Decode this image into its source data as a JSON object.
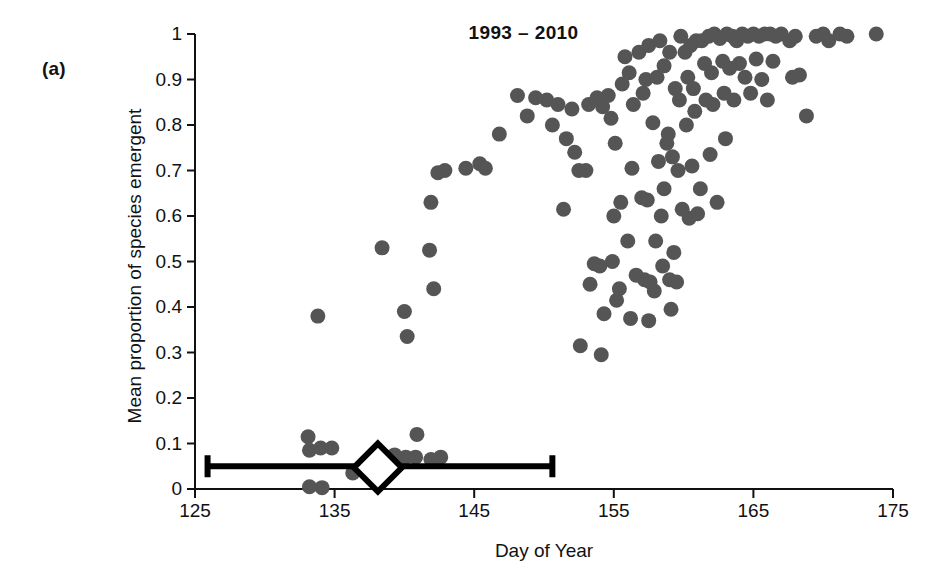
{
  "panel": {
    "label": "(a)"
  },
  "chart_data": {
    "type": "scatter",
    "title": "1993 – 2010",
    "xlabel": "Day of Year",
    "ylabel": "Mean proportion of species emergent",
    "xlim": [
      125,
      175
    ],
    "ylim": [
      0,
      1
    ],
    "xticks": [
      125,
      135,
      145,
      155,
      165,
      175
    ],
    "xtick_labels": [
      "125",
      "135",
      "145",
      "155",
      "165",
      "175"
    ],
    "yticks": [
      0,
      0.1,
      0.2,
      0.3,
      0.4,
      0.5,
      0.6,
      0.7,
      0.8,
      0.9,
      1
    ],
    "ytick_labels": [
      "0",
      "0.1",
      "0.2",
      "0.3",
      "0.4",
      "0.5",
      "0.6",
      "0.7",
      "0.8",
      "0.9",
      "1"
    ],
    "grid": false,
    "legend": "none",
    "marker": {
      "shape": "circle",
      "color": "#555555",
      "size_px": 15
    },
    "points": [
      [
        133.1,
        0.115
      ],
      [
        133.2,
        0.085
      ],
      [
        134.0,
        0.09
      ],
      [
        134.8,
        0.09
      ],
      [
        133.2,
        0.005
      ],
      [
        134.1,
        0.003
      ],
      [
        133.8,
        0.38
      ],
      [
        136.3,
        0.035
      ],
      [
        137.7,
        0.04
      ],
      [
        139.3,
        0.075
      ],
      [
        140.1,
        0.07
      ],
      [
        140.8,
        0.07
      ],
      [
        142.6,
        0.07
      ],
      [
        140.9,
        0.12
      ],
      [
        141.9,
        0.065
      ],
      [
        138.4,
        0.53
      ],
      [
        140.0,
        0.39
      ],
      [
        140.2,
        0.335
      ],
      [
        141.8,
        0.525
      ],
      [
        142.1,
        0.44
      ],
      [
        142.4,
        0.695
      ],
      [
        142.9,
        0.7
      ],
      [
        141.9,
        0.63
      ],
      [
        144.4,
        0.705
      ],
      [
        145.4,
        0.715
      ],
      [
        145.8,
        0.705
      ],
      [
        146.8,
        0.78
      ],
      [
        148.1,
        0.865
      ],
      [
        151.4,
        0.615
      ],
      [
        152.5,
        0.7
      ],
      [
        152.0,
        0.835
      ],
      [
        153.2,
        0.845
      ],
      [
        154.2,
        0.84
      ],
      [
        152.6,
        0.315
      ],
      [
        154.1,
        0.295
      ],
      [
        153.3,
        0.45
      ],
      [
        153.6,
        0.495
      ],
      [
        154.0,
        0.49
      ],
      [
        154.3,
        0.385
      ],
      [
        155.2,
        0.415
      ],
      [
        155.4,
        0.44
      ],
      [
        155.0,
        0.6
      ],
      [
        155.5,
        0.63
      ],
      [
        154.8,
        0.815
      ],
      [
        155.6,
        0.89
      ],
      [
        156.1,
        0.915
      ],
      [
        156.4,
        0.845
      ],
      [
        157.1,
        0.87
      ],
      [
        157.3,
        0.9
      ],
      [
        156.3,
        0.705
      ],
      [
        157.0,
        0.64
      ],
      [
        157.4,
        0.635
      ],
      [
        156.6,
        0.47
      ],
      [
        157.2,
        0.46
      ],
      [
        157.6,
        0.455
      ],
      [
        156.2,
        0.375
      ],
      [
        157.5,
        0.37
      ],
      [
        158.0,
        0.545
      ],
      [
        158.4,
        0.6
      ],
      [
        158.6,
        0.66
      ],
      [
        158.2,
        0.72
      ],
      [
        158.8,
        0.76
      ],
      [
        158.1,
        0.905
      ],
      [
        158.6,
        0.93
      ],
      [
        159.0,
        0.96
      ],
      [
        159.4,
        0.88
      ],
      [
        159.7,
        0.855
      ],
      [
        159.2,
        0.73
      ],
      [
        159.6,
        0.7
      ],
      [
        159.0,
        0.46
      ],
      [
        159.5,
        0.455
      ],
      [
        159.3,
        0.52
      ],
      [
        160.1,
        0.96
      ],
      [
        160.5,
        0.975
      ],
      [
        160.9,
        0.985
      ],
      [
        160.3,
        0.905
      ],
      [
        160.7,
        0.88
      ],
      [
        160.2,
        0.8
      ],
      [
        160.8,
        0.83
      ],
      [
        160.4,
        0.595
      ],
      [
        161.0,
        0.605
      ],
      [
        161.3,
        0.985
      ],
      [
        161.8,
        0.995
      ],
      [
        162.2,
        1.0
      ],
      [
        161.5,
        0.935
      ],
      [
        162.0,
        0.915
      ],
      [
        161.6,
        0.855
      ],
      [
        162.1,
        0.845
      ],
      [
        161.2,
        0.66
      ],
      [
        162.4,
        0.63
      ],
      [
        162.6,
        0.99
      ],
      [
        163.1,
        1.0
      ],
      [
        163.5,
        0.995
      ],
      [
        162.8,
        0.94
      ],
      [
        163.3,
        0.925
      ],
      [
        163.8,
        0.985
      ],
      [
        164.2,
        1.0
      ],
      [
        164.6,
        0.995
      ],
      [
        164.0,
        0.935
      ],
      [
        164.4,
        0.905
      ],
      [
        165.0,
        1.0
      ],
      [
        165.4,
        0.995
      ],
      [
        165.8,
        1.0
      ],
      [
        165.2,
        0.945
      ],
      [
        166.2,
        1.0
      ],
      [
        166.6,
        0.995
      ],
      [
        167.0,
        1.0
      ],
      [
        166.4,
        0.94
      ],
      [
        167.6,
        0.985
      ],
      [
        168.0,
        0.995
      ],
      [
        167.8,
        0.905
      ],
      [
        168.3,
        0.91
      ],
      [
        168.8,
        0.82
      ],
      [
        169.5,
        0.995
      ],
      [
        170.0,
        1.0
      ],
      [
        170.4,
        0.985
      ],
      [
        171.2,
        1.0
      ],
      [
        171.7,
        0.995
      ],
      [
        173.8,
        1.0
      ],
      [
        150.2,
        0.855
      ],
      [
        151.0,
        0.845
      ],
      [
        149.4,
        0.86
      ],
      [
        156.8,
        0.96
      ],
      [
        157.5,
        0.975
      ],
      [
        155.8,
        0.95
      ],
      [
        153.8,
        0.86
      ],
      [
        154.6,
        0.865
      ],
      [
        158.3,
        0.985
      ],
      [
        159.8,
        0.995
      ],
      [
        150.6,
        0.8
      ],
      [
        151.6,
        0.77
      ],
      [
        152.2,
        0.74
      ],
      [
        148.8,
        0.82
      ],
      [
        157.8,
        0.805
      ],
      [
        158.9,
        0.78
      ],
      [
        160.6,
        0.71
      ],
      [
        162.9,
        0.87
      ],
      [
        163.6,
        0.855
      ],
      [
        155.1,
        0.76
      ],
      [
        159.9,
        0.615
      ],
      [
        161.9,
        0.735
      ],
      [
        153.0,
        0.7
      ],
      [
        156.0,
        0.545
      ],
      [
        158.5,
        0.49
      ],
      [
        154.9,
        0.5
      ],
      [
        157.9,
        0.435
      ],
      [
        159.1,
        0.395
      ],
      [
        163.0,
        0.77
      ],
      [
        164.8,
        0.87
      ],
      [
        166.0,
        0.855
      ],
      [
        165.6,
        0.9
      ]
    ],
    "summary_marker": {
      "label": "mean-with-range",
      "shape": "diamond",
      "x": 138.1,
      "y": 0.047,
      "fill": "#ffffff",
      "stroke": "#000000",
      "error_bar": {
        "xmin": 125.9,
        "xmax": 150.6,
        "y": 0.05
      }
    }
  }
}
